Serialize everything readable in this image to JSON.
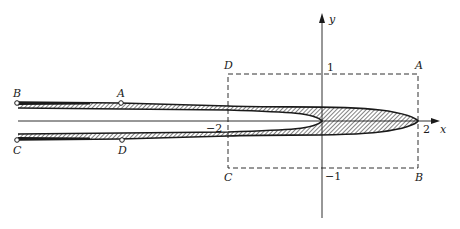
{
  "axes": {
    "x_label": "x",
    "y_label": "y",
    "ticks": {
      "x_pos": "2",
      "x_neg": "−2",
      "y_pos": "1",
      "y_neg": "−1"
    }
  },
  "rectangle": {
    "style": "dashed",
    "corners": {
      "top_right": "A",
      "bottom_right": "B",
      "bottom_left": "C",
      "top_left": "D"
    }
  },
  "strip": {
    "labels": {
      "top_left_end": "B",
      "top_mid": "A",
      "bottom_left_end": "C",
      "bottom_mid": "D"
    }
  },
  "colors": {
    "ink": "#1a1a1a",
    "background": "#ffffff"
  }
}
